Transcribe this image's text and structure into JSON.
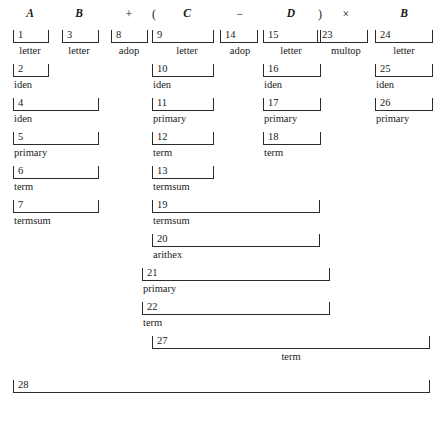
{
  "figure": {
    "width": 443,
    "height": 440,
    "ink_color": "#1a1a1a",
    "rule_color": "#2b2b2b"
  },
  "input_tokens": [
    {
      "text": "A",
      "kind": "identifier",
      "x": 30
    },
    {
      "text": "B",
      "kind": "identifier",
      "x": 79
    },
    {
      "text": "+",
      "kind": "operator",
      "x": 129
    },
    {
      "text": "(",
      "kind": "operator",
      "x": 154
    },
    {
      "text": "C",
      "kind": "identifier",
      "x": 187
    },
    {
      "text": "−",
      "kind": "operator",
      "x": 240
    },
    {
      "text": "D",
      "kind": "identifier",
      "x": 291
    },
    {
      "text": ")",
      "kind": "operator",
      "x": 320
    },
    {
      "text": "×",
      "kind": "operator",
      "x": 346
    },
    {
      "text": "B",
      "kind": "identifier",
      "x": 404
    }
  ],
  "nodes": [
    {
      "id": "n1",
      "number": "1",
      "label": "letter",
      "x": 13,
      "width": 36,
      "y": 30,
      "label_x": 30,
      "label_align": "center"
    },
    {
      "id": "n3",
      "number": "3",
      "label": "letter",
      "x": 62,
      "width": 37,
      "y": 30,
      "label_x": 79,
      "label_align": "center"
    },
    {
      "id": "n8",
      "number": "8",
      "label": "adop",
      "x": 111,
      "width": 37,
      "y": 30,
      "label_x": 129,
      "label_align": "center"
    },
    {
      "id": "n9",
      "number": "9",
      "label": "letter",
      "x": 152,
      "width": 62,
      "y": 30,
      "label_x": 187,
      "label_align": "center"
    },
    {
      "id": "n14",
      "number": "14",
      "label": "adop",
      "x": 220,
      "width": 38,
      "y": 30,
      "label_x": 240,
      "label_align": "center"
    },
    {
      "id": "n15",
      "number": "15",
      "label": "letter",
      "x": 263,
      "width": 58,
      "y": 30,
      "label_x": 291,
      "label_align": "center"
    },
    {
      "id": "n23",
      "number": "23",
      "label": "multop",
      "x": 317,
      "width": 51,
      "y": 30,
      "label_x": 346,
      "label_align": "center"
    },
    {
      "id": "n24",
      "number": "24",
      "label": "letter",
      "x": 375,
      "width": 58,
      "y": 30,
      "label_x": 404,
      "label_align": "center"
    },
    {
      "id": "n2",
      "number": "2",
      "label": "iden",
      "x": 13,
      "width": 36,
      "y": 64,
      "label_x": 14,
      "label_align": "left"
    },
    {
      "id": "n10",
      "number": "10",
      "label": "iden",
      "x": 152,
      "width": 62,
      "y": 64,
      "label_x": 153,
      "label_align": "left"
    },
    {
      "id": "n16",
      "number": "16",
      "label": "iden",
      "x": 263,
      "width": 58,
      "y": 64,
      "label_x": 264,
      "label_align": "left"
    },
    {
      "id": "n25",
      "number": "25",
      "label": "iden",
      "x": 375,
      "width": 58,
      "y": 64,
      "label_x": 376,
      "label_align": "left"
    },
    {
      "id": "n4",
      "number": "4",
      "label": "iden",
      "x": 13,
      "width": 86,
      "y": 98,
      "label_x": 14,
      "label_align": "left"
    },
    {
      "id": "n11",
      "number": "11",
      "label": "primary",
      "x": 152,
      "width": 62,
      "y": 98,
      "label_x": 153,
      "label_align": "left"
    },
    {
      "id": "n17",
      "number": "17",
      "label": "primary",
      "x": 263,
      "width": 58,
      "y": 98,
      "label_x": 264,
      "label_align": "left"
    },
    {
      "id": "n26",
      "number": "26",
      "label": "primary",
      "x": 375,
      "width": 58,
      "y": 98,
      "label_x": 376,
      "label_align": "left"
    },
    {
      "id": "n5",
      "number": "5",
      "label": "primary",
      "x": 13,
      "width": 86,
      "y": 132,
      "label_x": 14,
      "label_align": "left"
    },
    {
      "id": "n12",
      "number": "12",
      "label": "term",
      "x": 152,
      "width": 62,
      "y": 132,
      "label_x": 153,
      "label_align": "left"
    },
    {
      "id": "n18",
      "number": "18",
      "label": "term",
      "x": 263,
      "width": 58,
      "y": 132,
      "label_x": 264,
      "label_align": "left"
    },
    {
      "id": "n6",
      "number": "6",
      "label": "term",
      "x": 13,
      "width": 86,
      "y": 166,
      "label_x": 14,
      "label_align": "left"
    },
    {
      "id": "n13",
      "number": "13",
      "label": "termsum",
      "x": 152,
      "width": 62,
      "y": 166,
      "label_x": 153,
      "label_align": "left"
    },
    {
      "id": "n7",
      "number": "7",
      "label": "termsum",
      "x": 13,
      "width": 86,
      "y": 200,
      "label_x": 14,
      "label_align": "left"
    },
    {
      "id": "n19",
      "number": "19",
      "label": "termsum",
      "x": 152,
      "width": 168,
      "y": 200,
      "label_x": 153,
      "label_align": "left"
    },
    {
      "id": "n20",
      "number": "20",
      "label": "arithex",
      "x": 152,
      "width": 168,
      "y": 234,
      "label_x": 153,
      "label_align": "left"
    },
    {
      "id": "n21",
      "number": "21",
      "label": "primary",
      "x": 142,
      "width": 188,
      "y": 268,
      "label_x": 143,
      "label_align": "left"
    },
    {
      "id": "n22",
      "number": "22",
      "label": "term",
      "x": 142,
      "width": 188,
      "y": 302,
      "label_x": 143,
      "label_align": "left"
    },
    {
      "id": "n27",
      "number": "27",
      "label": "term",
      "x": 152,
      "width": 278,
      "y": 336,
      "label_x": 291,
      "label_align": "center"
    },
    {
      "id": "n28",
      "number": "28",
      "label": "",
      "x": 13,
      "width": 417,
      "y": 380,
      "label_x": 14,
      "label_align": "left"
    }
  ]
}
